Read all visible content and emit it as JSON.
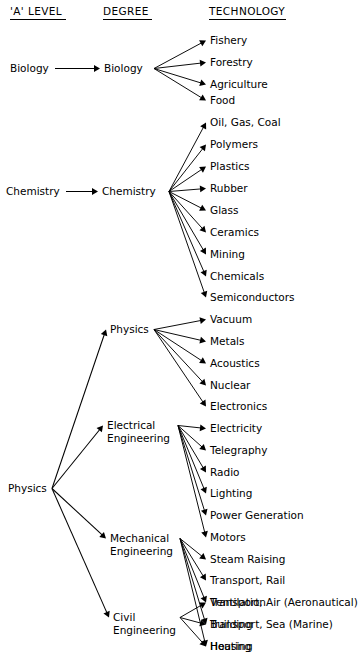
{
  "page": {
    "background_color": "#ffffff",
    "ink_color": "#000000",
    "width": 364,
    "height": 659
  },
  "columns": [
    {
      "id": "a-level",
      "label": "'A' LEVEL",
      "x": 10,
      "y": 15,
      "underline_width": 56
    },
    {
      "id": "degree",
      "label": "DEGREE",
      "x": 103,
      "y": 15,
      "underline_width": 49
    },
    {
      "id": "technology",
      "label": "TECHNOLOGY",
      "x": 209,
      "y": 15,
      "underline_width": 77
    }
  ],
  "a_levels": [
    {
      "id": "a-biology",
      "label": "Biology",
      "x": 10,
      "y": 72,
      "hub_x": 52,
      "text_end_x": 49
    },
    {
      "id": "a-chemistry",
      "label": "Chemistry",
      "x": 6,
      "y": 195,
      "hub_x": 62,
      "text_end_x": 60
    },
    {
      "id": "a-physics",
      "label": "Physics",
      "x": 8,
      "y": 492,
      "hub_x": 52,
      "text_end_x": 48
    }
  ],
  "degrees": [
    {
      "id": "d-biology",
      "label": "Biology",
      "lines": [
        "Biology"
      ],
      "x": 104,
      "y": 72,
      "hub_x": 152,
      "entry_x": 100
    },
    {
      "id": "d-chemistry",
      "label": "Chemistry",
      "lines": [
        "Chemistry"
      ],
      "x": 102,
      "y": 195,
      "hub_x": 167,
      "entry_x": 98
    },
    {
      "id": "d-physics",
      "label": "Physics",
      "lines": [
        "Physics"
      ],
      "x": 110,
      "y": 333,
      "hub_x": 152,
      "entry_x": 106
    },
    {
      "id": "d-electrical",
      "label": "Electrical Engineering",
      "lines": [
        "Electrical",
        "Engineering"
      ],
      "x": 107,
      "y": 429,
      "hub_x": 176,
      "entry_x": 103
    },
    {
      "id": "d-mechanical",
      "label": "Mechanical Engineering",
      "lines": [
        "Mechanical",
        "Engineering"
      ],
      "x": 110,
      "y": 542,
      "hub_x": 178,
      "entry_x": 106
    },
    {
      "id": "d-civil",
      "label": "Civil Engineering",
      "lines": [
        "Civil",
        "Engineering"
      ],
      "x": 113,
      "y": 621,
      "hub_x": 178,
      "entry_x": 109
    }
  ],
  "technologies": [
    {
      "id": "t-fishery",
      "label": "Fishery",
      "y": 44,
      "degree": "d-biology"
    },
    {
      "id": "t-forestry",
      "label": "Forestry",
      "y": 66,
      "degree": "d-biology"
    },
    {
      "id": "t-agriculture",
      "label": "Agriculture",
      "y": 88,
      "degree": "d-biology"
    },
    {
      "id": "t-food",
      "label": "Food",
      "y": 104,
      "degree": "d-biology"
    },
    {
      "id": "t-oil-gas-coal",
      "label": "Oil, Gas, Coal",
      "y": 126,
      "degree": "d-chemistry"
    },
    {
      "id": "t-polymers",
      "label": "Polymers",
      "y": 148,
      "degree": "d-chemistry"
    },
    {
      "id": "t-plastics",
      "label": "Plastics",
      "y": 170,
      "degree": "d-chemistry"
    },
    {
      "id": "t-rubber",
      "label": "Rubber",
      "y": 192,
      "degree": "d-chemistry"
    },
    {
      "id": "t-glass",
      "label": "Glass",
      "y": 214,
      "degree": "d-chemistry"
    },
    {
      "id": "t-ceramics",
      "label": "Ceramics",
      "y": 236,
      "degree": "d-chemistry"
    },
    {
      "id": "t-mining",
      "label": "Mining",
      "y": 258,
      "degree": "d-chemistry"
    },
    {
      "id": "t-chemicals",
      "label": "Chemicals",
      "y": 280,
      "degree": "d-chemistry"
    },
    {
      "id": "t-semiconductors",
      "label": "Semiconductors",
      "y": 301,
      "degree": "d-chemistry"
    },
    {
      "id": "t-vacuum",
      "label": "Vacuum",
      "y": 323,
      "degree": "d-physics"
    },
    {
      "id": "t-metals",
      "label": "Metals",
      "y": 345,
      "degree": "d-physics"
    },
    {
      "id": "t-acoustics",
      "label": "Acoustics",
      "y": 367,
      "degree": "d-physics"
    },
    {
      "id": "t-nuclear",
      "label": "Nuclear",
      "y": 389,
      "degree": "d-physics"
    },
    {
      "id": "t-electronics",
      "label": "Electronics",
      "y": 410,
      "degree": "d-physics"
    },
    {
      "id": "t-electricity",
      "label": "Electricity",
      "y": 432,
      "degree": "d-electrical"
    },
    {
      "id": "t-telegraphy",
      "label": "Telegraphy",
      "y": 454,
      "degree": "d-electrical"
    },
    {
      "id": "t-radio",
      "label": "Radio",
      "y": 476,
      "degree": "d-electrical"
    },
    {
      "id": "t-lighting",
      "label": "Lighting",
      "y": 497,
      "degree": "d-electrical"
    },
    {
      "id": "t-power-gen",
      "label": "Power Generation",
      "y": 519,
      "degree": "d-electrical"
    },
    {
      "id": "t-motors",
      "label": "Motors",
      "y": 541,
      "degree": "d-electrical"
    },
    {
      "id": "t-steam-raising",
      "label": "Steam Raising",
      "y": 563,
      "degree": "d-mechanical"
    },
    {
      "id": "t-transport-rail",
      "label": "Transport, Rail",
      "y": 584,
      "degree": "d-mechanical"
    },
    {
      "id": "t-transport-air",
      "label": "Transport, Air (Aeronautical)",
      "y": 606,
      "degree": "d-mechanical"
    },
    {
      "id": "t-transport-sea",
      "label": "Transport, Sea (Marine)",
      "y": 628,
      "degree": "d-mechanical"
    },
    {
      "id": "t-heating",
      "label": "Heating",
      "y": 650,
      "degree": "d-mechanical"
    },
    {
      "id": "t-ventilation",
      "label": "Ventilation",
      "y": 606,
      "degree": "d-civil"
    },
    {
      "id": "t-building",
      "label": "Building",
      "y": 628,
      "degree": "d-civil"
    },
    {
      "id": "t-housing",
      "label": "Housing",
      "y": 650,
      "degree": "d-civil"
    }
  ],
  "tech_column": {
    "label_x": 210,
    "arrow_tip_x": 206
  },
  "physics_fan": {
    "from": "a-physics",
    "to": [
      "d-physics",
      "d-electrical",
      "d-mechanical",
      "d-civil"
    ]
  },
  "edge_style": {
    "stroke": "#000000",
    "stroke_width": 1.05,
    "arrow_head_length": 6,
    "arrow_head_width": 3.4
  }
}
